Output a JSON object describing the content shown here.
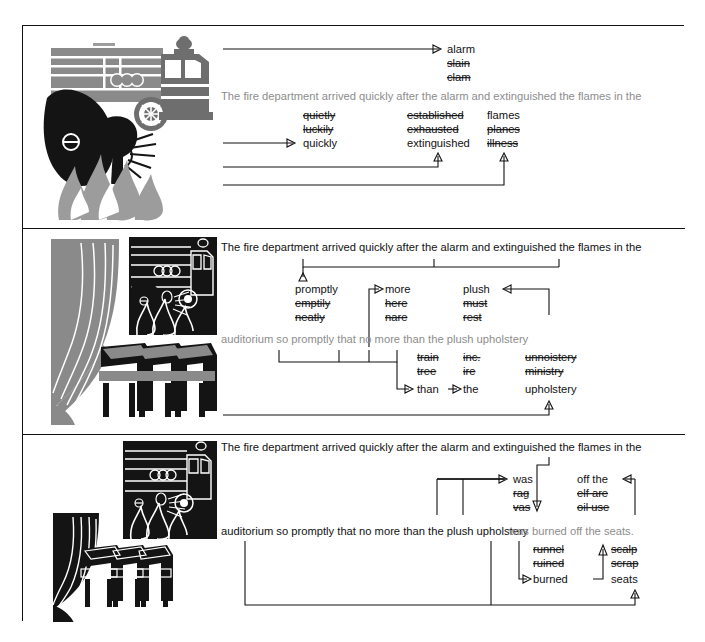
{
  "figure": {
    "panels": [
      {
        "id": "panel-1",
        "illustration": "fire-truck-smoke-flames-firefighter",
        "sentence_line_1": "",
        "sentence_line_2": "The fire department arrived quickly after the alarm and extinguished the flames in the",
        "sentence_faded": true,
        "alternatives": [
          {
            "id": "alarm",
            "options": [
              "alarm",
              "slain",
              "clam"
            ],
            "correct": "alarm",
            "struck": [
              "slain",
              "clam"
            ]
          },
          {
            "id": "quickly",
            "options": [
              "quietly",
              "luckily",
              "quickly"
            ],
            "correct": "quickly",
            "struck": [
              "quietly",
              "luckily"
            ]
          },
          {
            "id": "extinguished",
            "options": [
              "established",
              "exhausted",
              "extinguished"
            ],
            "correct": "extinguished",
            "struck": [
              "established",
              "exhausted"
            ]
          },
          {
            "id": "flames",
            "options": [
              "flames",
              "planes",
              "illness"
            ],
            "correct": "flames",
            "struck": [
              "planes",
              "illness"
            ]
          }
        ]
      },
      {
        "id": "panel-2",
        "illustration": "theater-curtain-seats-with-fire-truck-inset",
        "sentence_line_1": "The fire department arrived quickly after the alarm and extinguished the flames in the",
        "sentence_line_2": "auditorium so promptly that no more than the plush upholstery",
        "sentence_faded": true,
        "alternatives": [
          {
            "id": "promptly",
            "options": [
              "promptly",
              "emptily",
              "neatly"
            ],
            "correct": "promptly",
            "struck": [
              "emptily",
              "neatly"
            ]
          },
          {
            "id": "more",
            "options": [
              "more",
              "here",
              "nare"
            ],
            "correct": "more",
            "struck": [
              "here",
              "nare"
            ]
          },
          {
            "id": "plush",
            "options": [
              "plush",
              "must",
              "rest"
            ],
            "correct": "plush",
            "struck": [
              "must",
              "rest"
            ]
          },
          {
            "id": "than",
            "options": [
              "train",
              "tree",
              "than"
            ],
            "correct": "than",
            "struck": [
              "train",
              "tree"
            ]
          },
          {
            "id": "the",
            "options": [
              "inc.",
              "ire",
              "the"
            ],
            "correct": "the",
            "struck": [
              "inc.",
              "ire"
            ]
          },
          {
            "id": "upholstery",
            "options": [
              "unnoistery",
              "ministry",
              "upholstery"
            ],
            "correct": "upholstery",
            "struck": [
              "unnoistery",
              "ministry"
            ]
          }
        ]
      },
      {
        "id": "panel-3",
        "illustration": "burned-curtain-seats-with-fire-truck-inset",
        "sentence_line_1": "The fire department arrived quickly after the alarm and extinguished the flames in the",
        "sentence_line_2": "auditorium so promptly that no more than the plush upholstery was burned off the seats.",
        "sentence_faded_tail": "was burned off the seats.",
        "sentence_plain_head": "auditorium so promptly that no more than the plush upholstery ",
        "alternatives": [
          {
            "id": "was",
            "options": [
              "was",
              "rag",
              "vas"
            ],
            "correct": "was",
            "struck": [
              "rag",
              "vas"
            ]
          },
          {
            "id": "off-the",
            "options": [
              "off the",
              "elf are",
              "oil use"
            ],
            "correct": "off the",
            "struck": [
              "elf are",
              "oil use"
            ]
          },
          {
            "id": "burned",
            "options": [
              "runnel",
              "ruined",
              "burned"
            ],
            "correct": "burned",
            "struck": [
              "runnel",
              "ruined"
            ]
          },
          {
            "id": "seats",
            "options": [
              "scalp",
              "scrap",
              "seats"
            ],
            "correct": "seats",
            "struck": [
              "scalp",
              "scrap"
            ]
          }
        ]
      }
    ]
  },
  "colors": {
    "ink": "#111111",
    "faded_ink": "#8d8d8d",
    "art_light_gray": "#9c9c9c",
    "art_mid_gray": "#8a8a8a",
    "art_dark_gray": "#6e6e6e",
    "art_black": "#141414",
    "page": "#ffffff"
  }
}
